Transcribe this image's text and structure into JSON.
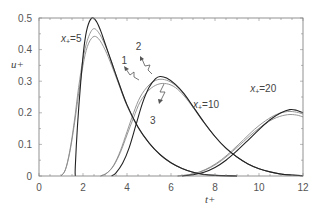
{
  "chart_data": {
    "type": "line",
    "title": "",
    "xlabel": "t+",
    "ylabel": "u+",
    "xlim": [
      0,
      12
    ],
    "ylim": [
      0,
      0.5
    ],
    "xticks": [
      0,
      2,
      4,
      6,
      8,
      10,
      12
    ],
    "yticks": [
      0,
      0.1,
      0.2,
      0.3,
      0.4,
      0.5
    ],
    "xtick_labels": [
      "0",
      "2",
      "4",
      "6",
      "8",
      "10",
      "12"
    ],
    "ytick_labels": [
      "0",
      "0.1",
      "0.2",
      "0.3",
      "0.4",
      "0.5"
    ],
    "grid": false,
    "legend": null,
    "annotations": [
      {
        "text": "x+=5",
        "t": 1.0,
        "u": 0.425
      },
      {
        "text": "x+=10",
        "t": 7.0,
        "u": 0.215
      },
      {
        "text": "x+=20",
        "t": 9.6,
        "u": 0.265
      },
      {
        "text": "1",
        "t": 3.75,
        "u": 0.355
      },
      {
        "text": "2",
        "t": 4.4,
        "u": 0.4
      },
      {
        "text": "3",
        "t": 5.05,
        "u": 0.165
      }
    ],
    "series": [
      {
        "name": "x+=5 curve 1",
        "group": "x+=5",
        "color": "#222222",
        "points": [
          [
            1.65,
            0
          ],
          [
            1.65,
            0.03
          ],
          [
            1.75,
            0.16
          ],
          [
            1.9,
            0.3
          ],
          [
            2.05,
            0.41
          ],
          [
            2.2,
            0.47
          ],
          [
            2.4,
            0.5
          ],
          [
            2.6,
            0.49
          ],
          [
            2.8,
            0.46
          ],
          [
            3.0,
            0.42
          ],
          [
            3.3,
            0.36
          ],
          [
            3.6,
            0.3
          ],
          [
            4.0,
            0.225
          ],
          [
            4.5,
            0.155
          ],
          [
            5.0,
            0.105
          ],
          [
            5.5,
            0.068
          ],
          [
            6.0,
            0.042
          ],
          [
            6.5,
            0.024
          ],
          [
            7.0,
            0.012
          ],
          [
            7.5,
            0.005
          ],
          [
            8.0,
            0.002
          ],
          [
            9.0,
            0
          ]
        ]
      },
      {
        "name": "x+=5 curve 2",
        "group": "x+=5",
        "color": "#8a8a8a",
        "points": [
          [
            1.0,
            0
          ],
          [
            1.2,
            0.02
          ],
          [
            1.4,
            0.08
          ],
          [
            1.6,
            0.17
          ],
          [
            1.8,
            0.28
          ],
          [
            2.0,
            0.37
          ],
          [
            2.2,
            0.43
          ],
          [
            2.45,
            0.465
          ],
          [
            2.7,
            0.455
          ],
          [
            3.0,
            0.415
          ],
          [
            3.3,
            0.36
          ],
          [
            3.6,
            0.3
          ],
          [
            4.0,
            0.225
          ],
          [
            4.5,
            0.155
          ],
          [
            5.0,
            0.105
          ],
          [
            5.5,
            0.068
          ],
          [
            6.0,
            0.042
          ],
          [
            6.5,
            0.024
          ],
          [
            7.0,
            0.012
          ],
          [
            7.5,
            0.005
          ],
          [
            8.0,
            0.002
          ],
          [
            9.0,
            0
          ]
        ]
      },
      {
        "name": "x+=5 curve 3",
        "group": "x+=5",
        "color": "#8a8a8a",
        "points": [
          [
            1.0,
            0
          ],
          [
            1.2,
            0.02
          ],
          [
            1.4,
            0.075
          ],
          [
            1.6,
            0.16
          ],
          [
            1.8,
            0.26
          ],
          [
            2.0,
            0.35
          ],
          [
            2.2,
            0.41
          ],
          [
            2.45,
            0.44
          ],
          [
            2.7,
            0.435
          ],
          [
            3.0,
            0.4
          ],
          [
            3.3,
            0.35
          ],
          [
            3.6,
            0.295
          ],
          [
            4.0,
            0.222
          ],
          [
            4.5,
            0.153
          ],
          [
            5.0,
            0.104
          ],
          [
            5.5,
            0.067
          ],
          [
            6.0,
            0.041
          ],
          [
            6.5,
            0.024
          ],
          [
            7.0,
            0.012
          ],
          [
            7.5,
            0.005
          ],
          [
            8.0,
            0.002
          ],
          [
            9.0,
            0
          ]
        ]
      },
      {
        "name": "x+=10 curve 1",
        "group": "x+=10",
        "color": "#222222",
        "points": [
          [
            3.3,
            0
          ],
          [
            3.5,
            0.01
          ],
          [
            3.8,
            0.04
          ],
          [
            4.1,
            0.09
          ],
          [
            4.4,
            0.16
          ],
          [
            4.7,
            0.23
          ],
          [
            5.0,
            0.28
          ],
          [
            5.3,
            0.308
          ],
          [
            5.5,
            0.315
          ],
          [
            5.8,
            0.31
          ],
          [
            6.2,
            0.29
          ],
          [
            6.6,
            0.26
          ],
          [
            7.0,
            0.22
          ],
          [
            7.5,
            0.17
          ],
          [
            8.0,
            0.125
          ],
          [
            8.5,
            0.088
          ],
          [
            9.0,
            0.06
          ],
          [
            9.5,
            0.038
          ],
          [
            10.0,
            0.023
          ],
          [
            10.5,
            0.013
          ],
          [
            11.0,
            0.006
          ],
          [
            11.5,
            0.003
          ],
          [
            12.0,
            0.001
          ]
        ]
      },
      {
        "name": "x+=10 curve 2",
        "group": "x+=10",
        "color": "#8a8a8a",
        "points": [
          [
            2.8,
            0
          ],
          [
            3.1,
            0.01
          ],
          [
            3.4,
            0.035
          ],
          [
            3.7,
            0.08
          ],
          [
            4.0,
            0.14
          ],
          [
            4.3,
            0.2
          ],
          [
            4.6,
            0.25
          ],
          [
            5.0,
            0.288
          ],
          [
            5.4,
            0.305
          ],
          [
            5.8,
            0.303
          ],
          [
            6.2,
            0.287
          ],
          [
            6.6,
            0.258
          ],
          [
            7.0,
            0.22
          ],
          [
            7.5,
            0.17
          ],
          [
            8.0,
            0.125
          ],
          [
            8.5,
            0.088
          ],
          [
            9.0,
            0.06
          ],
          [
            9.5,
            0.038
          ],
          [
            10.0,
            0.023
          ],
          [
            10.5,
            0.013
          ],
          [
            11.0,
            0.006
          ],
          [
            11.5,
            0.003
          ],
          [
            12.0,
            0.001
          ]
        ]
      },
      {
        "name": "x+=10 curve 3",
        "group": "x+=10",
        "color": "#8a8a8a",
        "points": [
          [
            2.8,
            0
          ],
          [
            3.1,
            0.01
          ],
          [
            3.4,
            0.033
          ],
          [
            3.7,
            0.075
          ],
          [
            4.0,
            0.13
          ],
          [
            4.3,
            0.185
          ],
          [
            4.6,
            0.235
          ],
          [
            5.0,
            0.272
          ],
          [
            5.4,
            0.29
          ],
          [
            5.8,
            0.292
          ],
          [
            6.2,
            0.28
          ],
          [
            6.6,
            0.253
          ],
          [
            7.0,
            0.217
          ],
          [
            7.5,
            0.168
          ],
          [
            8.0,
            0.124
          ],
          [
            8.5,
            0.087
          ],
          [
            9.0,
            0.06
          ],
          [
            9.5,
            0.038
          ],
          [
            10.0,
            0.023
          ],
          [
            10.5,
            0.013
          ],
          [
            11.0,
            0.006
          ],
          [
            11.5,
            0.003
          ],
          [
            12.0,
            0.001
          ]
        ]
      },
      {
        "name": "x+=20 curve 1",
        "group": "x+=20",
        "color": "#222222",
        "points": [
          [
            6.5,
            0
          ],
          [
            7.0,
            0.004
          ],
          [
            7.5,
            0.012
          ],
          [
            8.0,
            0.027
          ],
          [
            8.5,
            0.05
          ],
          [
            9.0,
            0.08
          ],
          [
            9.5,
            0.113
          ],
          [
            10.0,
            0.147
          ],
          [
            10.5,
            0.178
          ],
          [
            11.0,
            0.2
          ],
          [
            11.4,
            0.21
          ],
          [
            11.7,
            0.208
          ],
          [
            12.0,
            0.2
          ]
        ]
      },
      {
        "name": "x+=20 curve 2",
        "group": "x+=20",
        "color": "#8a8a8a",
        "points": [
          [
            6.3,
            0
          ],
          [
            6.8,
            0.004
          ],
          [
            7.3,
            0.013
          ],
          [
            7.8,
            0.029
          ],
          [
            8.3,
            0.052
          ],
          [
            8.8,
            0.082
          ],
          [
            9.3,
            0.115
          ],
          [
            9.8,
            0.148
          ],
          [
            10.3,
            0.175
          ],
          [
            10.8,
            0.195
          ],
          [
            11.3,
            0.204
          ],
          [
            11.7,
            0.202
          ],
          [
            12.0,
            0.196
          ]
        ]
      },
      {
        "name": "x+=20 curve 3",
        "group": "x+=20",
        "color": "#8a8a8a",
        "points": [
          [
            6.3,
            0
          ],
          [
            6.8,
            0.004
          ],
          [
            7.3,
            0.012
          ],
          [
            7.8,
            0.027
          ],
          [
            8.3,
            0.049
          ],
          [
            8.8,
            0.078
          ],
          [
            9.3,
            0.109
          ],
          [
            9.8,
            0.14
          ],
          [
            10.3,
            0.166
          ],
          [
            10.8,
            0.185
          ],
          [
            11.3,
            0.194
          ],
          [
            11.7,
            0.193
          ],
          [
            12.0,
            0.187
          ]
        ]
      }
    ]
  },
  "labels": {
    "xlabel": "t+",
    "ylabel": "u+"
  }
}
